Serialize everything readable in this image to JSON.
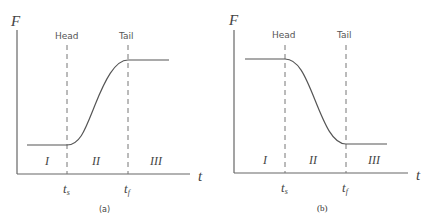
{
  "panels": [
    {
      "id": "a",
      "caption": "(a)",
      "y_axis_label": "F",
      "x_axis_label": "t",
      "head_label": "Head",
      "tail_label": "Tail",
      "ts_label": "t",
      "ts_sub": "s",
      "tf_label": "t",
      "tf_sub": "f",
      "regions": [
        "I",
        "II",
        "III"
      ],
      "shape": "rising sigmoid"
    },
    {
      "id": "b",
      "caption": "(b)",
      "y_axis_label": "F",
      "x_axis_label": "t",
      "head_label": "Head",
      "tail_label": "Tail",
      "ts_label": "t",
      "ts_sub": "s",
      "tf_label": "t",
      "tf_sub": "f",
      "regions": [
        "I",
        "II",
        "III"
      ],
      "shape": "falling sigmoid"
    }
  ],
  "colors": {
    "axis": "#666666",
    "curve": "#555555",
    "dashed": "#777777"
  }
}
